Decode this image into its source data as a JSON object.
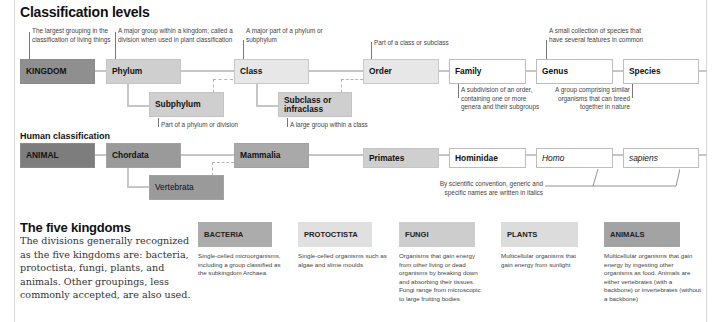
{
  "classification": {
    "title": "Classification levels",
    "levels": {
      "kingdom": "KINGDOM",
      "phylum": "Phylum",
      "subphylum": "Subphylum",
      "class": "Class",
      "subclass": "Subclass or infraclass",
      "order": "Order",
      "family": "Family",
      "genus": "Genus",
      "species": "Species"
    },
    "notes": {
      "kingdom": "The largest grouping in the classification of living things",
      "phylum": "A major group within a kingdom; called a division when used in plant classification",
      "class": "A major part of a phylum or subphylum",
      "order": "Part of a class or subclass",
      "genus": "A small collection of species that have several features in common",
      "subphylum": "Part of a phylum or division",
      "subclass": "A large group within a class",
      "family": "A subdivision of an order, containing one or more genera and their subgroups",
      "species": "A group comprising similar organisms that can breed together in nature"
    }
  },
  "human": {
    "title": "Human classification",
    "levels": {
      "kingdom": "ANIMAL",
      "phylum": "Chordata",
      "subphylum": "Vertebrata",
      "class": "Mammalia",
      "order": "Primates",
      "family": "Hominidae",
      "genus": "Homo",
      "species": "sapiens"
    },
    "italics_note": "By scientific convention, generic and specific names are written in italics"
  },
  "kingdoms": {
    "title": "The five kingdoms",
    "description": "The divisions generally recognized as the five kingdoms are: bacteria, protoctista, fungi, plants, and animals. Other groupings, less commonly accepted, are also used.",
    "items": [
      {
        "name": "BACTERIA",
        "desc": "Single-celled microorganisms, including a group classified as the subkingdom Archaea",
        "color": "#acacac"
      },
      {
        "name": "PROTOCTISTA",
        "desc": "Single-celled organisms such as algae and slime moulds",
        "color": "#e0e0e0"
      },
      {
        "name": "FUNGI",
        "desc": "Organisms that gain energy from other living or dead organisms by breaking down and absorbing their tissues. Fungi range from microscopic to large fruiting bodies",
        "color": "#cdcdcd"
      },
      {
        "name": "PLANTS",
        "desc": "Multicellular organisms that gain energy from sunlight",
        "color": "#dcdcdc"
      },
      {
        "name": "ANIMALS",
        "desc": "Multicellular organisms that gain energy by ingesting other organisms as food. Animals are either vertebrates (with a backbone) or invertebrates (without a backbone)",
        "color": "#a3a3a3"
      }
    ]
  }
}
